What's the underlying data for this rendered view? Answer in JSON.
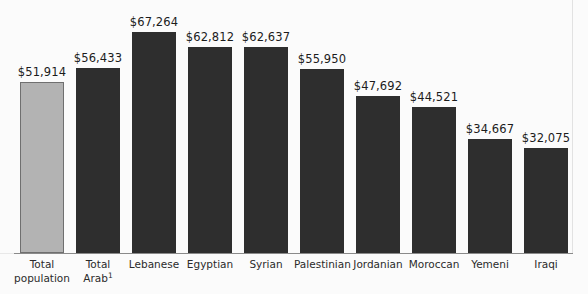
{
  "chart_data": {
    "type": "bar",
    "title": "",
    "subtitle": "",
    "xlabel": "",
    "ylabel": "",
    "ylim": [
      0,
      67264
    ],
    "grid": false,
    "legend": "none",
    "orientation": "vertical",
    "categories": [
      "Total population",
      "Total Arab",
      "Lebanese",
      "Egyptian",
      "Syrian",
      "Palestinian",
      "Jordanian",
      "Moroccan",
      "Yemeni",
      "Iraqi"
    ],
    "category_footnotes": [
      "",
      "1",
      "",
      "",
      "",
      "",
      "",
      "",
      "",
      ""
    ],
    "values": [
      51914,
      56433,
      67264,
      62812,
      62637,
      55950,
      47692,
      44521,
      34667,
      32075
    ],
    "value_labels": [
      "$51,914",
      "$56,433",
      "$67,264",
      "$62,812",
      "$62,637",
      "$55,950",
      "$47,692",
      "$44,521",
      "$34,667",
      "$32,075"
    ],
    "bar_styles": [
      "light",
      "dark",
      "dark",
      "dark",
      "dark",
      "dark",
      "dark",
      "dark",
      "dark",
      "dark"
    ],
    "colors": {
      "bar_dark": "#2e2e2e",
      "bar_light_fill": "#b3b3b3",
      "bar_light_border": "#6f6f6f",
      "background": "#fbfbfb",
      "label_text": "#1c1c1c",
      "category_text": "#2b2b2b",
      "baseline": "#8a8a8a"
    }
  },
  "labels": {
    "c0_line1": "Total",
    "c0_line2": "population",
    "c1_line1": "Total",
    "c1_line2": "Arab",
    "c1_sup": "1",
    "c2": "Lebanese",
    "c3": "Egyptian",
    "c4": "Syrian",
    "c5": "Palestinian",
    "c6": "Jordanian",
    "c7": "Moroccan",
    "c8": "Yemeni",
    "c9": "Iraqi"
  },
  "values": {
    "v0": "$51,914",
    "v1": "$56,433",
    "v2": "$67,264",
    "v3": "$62,812",
    "v4": "$62,637",
    "v5": "$55,950",
    "v6": "$47,692",
    "v7": "$44,521",
    "v8": "$34,667",
    "v9": "$32,075"
  }
}
